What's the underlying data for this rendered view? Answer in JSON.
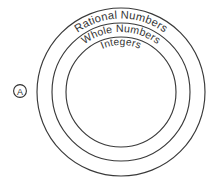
{
  "diagram": {
    "type": "nested-sets-venn",
    "title": "",
    "background_color": "#ffffff",
    "stroke_color": "#3a3a3a",
    "text_color": "#333333",
    "center": {
      "x": 121,
      "y": 92
    },
    "sets": [
      {
        "id": "rational-numbers",
        "label": "Rational Numbers",
        "level": 1,
        "radius": 84
      },
      {
        "id": "whole-numbers",
        "label": "Whole Numbers",
        "level": 2,
        "radius": 69
      },
      {
        "id": "integers",
        "label": "Integers",
        "level": 3,
        "radius": 55
      }
    ],
    "marker": {
      "label": "A",
      "shape": "circle",
      "x": 20,
      "y": 91
    }
  }
}
